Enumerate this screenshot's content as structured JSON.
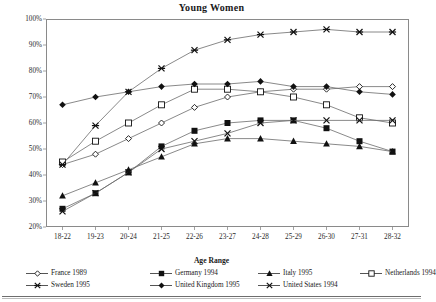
{
  "chart_data": {
    "type": "line",
    "title": "Young Women",
    "xlabel": "Age Range",
    "ylabel": "",
    "categories": [
      "18-22",
      "19-23",
      "20-24",
      "21-25",
      "22-26",
      "23-27",
      "24-28",
      "25-29",
      "26-30",
      "27-31",
      "28-32"
    ],
    "ylim": [
      20,
      100
    ],
    "ytick_labels": [
      "20%",
      "30%",
      "40%",
      "50%",
      "60%",
      "70%",
      "80%",
      "90%",
      "100%"
    ],
    "ytick_values": [
      20,
      30,
      40,
      50,
      60,
      70,
      80,
      90,
      100
    ],
    "grid": false,
    "legend_position": "bottom",
    "series": [
      {
        "name": "France 1989",
        "marker": "open-diamond",
        "values": [
          44,
          48,
          54,
          60,
          66,
          70,
          72,
          73,
          73,
          74,
          74
        ]
      },
      {
        "name": "Germany 1994",
        "marker": "filled-square",
        "values": [
          27,
          33,
          41,
          51,
          57,
          60,
          61,
          61,
          58,
          53,
          49
        ]
      },
      {
        "name": "Italy 1995",
        "marker": "filled-triangle",
        "values": [
          32,
          37,
          42,
          47,
          52,
          54,
          54,
          53,
          52,
          51,
          49
        ]
      },
      {
        "name": "Netherlands 1994",
        "marker": "open-square",
        "values": [
          45,
          53,
          60,
          67,
          73,
          73,
          72,
          70,
          67,
          62,
          60
        ]
      },
      {
        "name": "Sweden 1995",
        "marker": "star",
        "values": [
          44,
          59,
          72,
          81,
          88,
          92,
          94,
          95,
          96,
          95,
          95
        ]
      },
      {
        "name": "United Kingdom 1995",
        "marker": "filled-diamond",
        "values": [
          67,
          70,
          72,
          74,
          75,
          75,
          76,
          74,
          74,
          72,
          71
        ]
      },
      {
        "name": "United States 1994",
        "marker": "x-cross",
        "values": [
          26,
          33,
          41,
          50,
          53,
          56,
          60,
          61,
          61,
          61,
          61
        ]
      }
    ]
  },
  "axis": {
    "x_title": "Age Range"
  }
}
